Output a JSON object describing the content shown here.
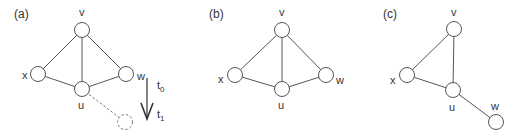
{
  "figure": {
    "panels": [
      {
        "id": "a",
        "label": "(a)",
        "nodes": {
          "v": "v",
          "x": "x",
          "w": "w",
          "u": "u"
        },
        "edges": [
          "v-x",
          "v-w",
          "v-u",
          "x-u",
          "w-u"
        ],
        "dashed_edge": "u-(new node)",
        "time_arrow": {
          "from": "t0",
          "to": "t1",
          "t0_label": "t",
          "t0_sub": "0",
          "t1_label": "t",
          "t1_sub": "1"
        }
      },
      {
        "id": "b",
        "label": "(b)",
        "nodes": {
          "v": "v",
          "x": "x",
          "w": "w",
          "u": "u"
        },
        "edges": [
          "v-x",
          "v-w",
          "v-u",
          "x-u",
          "w-u"
        ]
      },
      {
        "id": "c",
        "label": "(c)",
        "nodes": {
          "v": "v",
          "x": "x",
          "w": "w",
          "u": "u"
        },
        "edges": [
          "v-x",
          "v-u",
          "x-u",
          "u-w"
        ]
      }
    ],
    "colors": {
      "stroke": "#555555",
      "text": "#333333",
      "background": "#ffffff"
    }
  }
}
